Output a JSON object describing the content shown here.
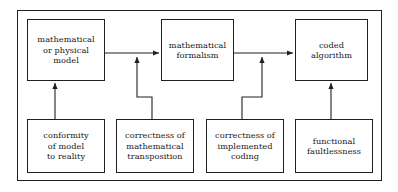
{
  "diagram": {
    "type": "flow-diagram",
    "frame": {
      "label": "outer-border"
    },
    "nodes": [
      {
        "id": "mathematical-or-physical-model",
        "label": "mathematical\nor physical\nmodel",
        "row": "top",
        "x": 27,
        "y": 19,
        "w": 78,
        "h": 62
      },
      {
        "id": "mathematical-formalism",
        "label": "mathematical\nformalism",
        "row": "top",
        "x": 161,
        "y": 19,
        "w": 73,
        "h": 62
      },
      {
        "id": "coded-algorithm",
        "label": "coded\nalgorithm",
        "row": "top",
        "x": 295,
        "y": 19,
        "w": 73,
        "h": 62
      },
      {
        "id": "conformity-of-model-to-reality",
        "label": "conformity\nof model\nto reality",
        "row": "bottom",
        "x": 27,
        "y": 119,
        "w": 78,
        "h": 54
      },
      {
        "id": "correctness-of-mathematical-transposition",
        "label": "correctness of\nmathematical\ntransposition",
        "row": "bottom",
        "x": 116,
        "y": 119,
        "w": 78,
        "h": 54
      },
      {
        "id": "correctness-of-implemented-coding",
        "label": "correctness of\nimplemented\ncoding",
        "row": "bottom",
        "x": 206,
        "y": 119,
        "w": 78,
        "h": 54
      },
      {
        "id": "functional-faultlessness",
        "label": "functional\nfaultlessness",
        "row": "bottom",
        "x": 295,
        "y": 119,
        "w": 78,
        "h": 54
      }
    ],
    "connectors": [
      {
        "id": "model-to-formalism",
        "from": "mathematical-or-physical-model",
        "to": "mathematical-formalism",
        "style": "horizontal-arrow"
      },
      {
        "id": "formalism-to-algorithm",
        "from": "mathematical-formalism",
        "to": "coded-algorithm",
        "style": "horizontal-arrow"
      },
      {
        "id": "conformity-to-model",
        "from": "conformity-of-model-to-reality",
        "to": "mathematical-or-physical-model",
        "style": "vertical-arrow"
      },
      {
        "id": "transposition-to-link",
        "from": "correctness-of-mathematical-transposition",
        "to": "model-to-formalism",
        "style": "jogged-vertical-arrow"
      },
      {
        "id": "coding-to-link",
        "from": "correctness-of-implemented-coding",
        "to": "formalism-to-algorithm",
        "style": "jogged-vertical-arrow"
      },
      {
        "id": "faultlessness-to-algorithm",
        "from": "functional-faultlessness",
        "to": "coded-algorithm",
        "style": "vertical-arrow"
      }
    ],
    "colors": {
      "line": "#231f20",
      "text": "#1a1718",
      "background": "#ffffff"
    }
  }
}
